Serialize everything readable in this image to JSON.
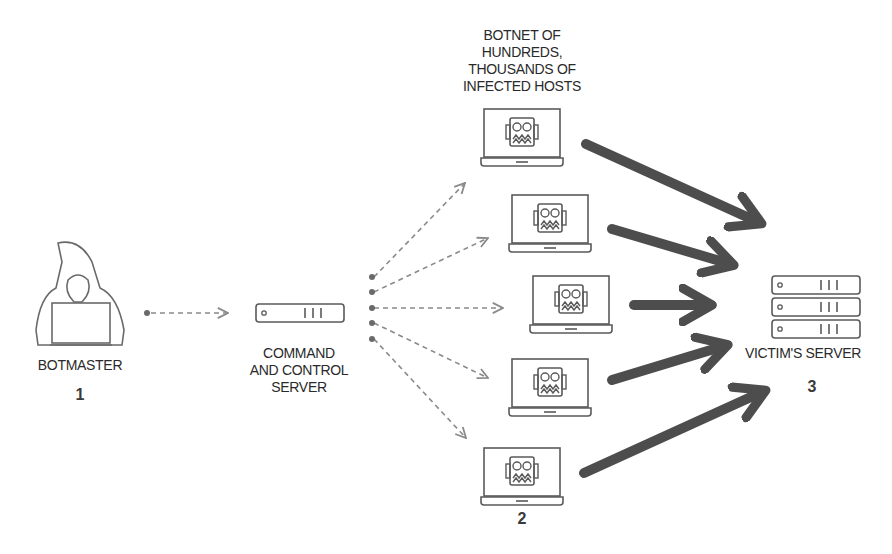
{
  "colors": {
    "line": "#5a5a5a",
    "dash": "#8a8a8a",
    "thick_arrow": "#4d4d4d",
    "background": "#ffffff"
  },
  "nodes": {
    "botmaster": {
      "label": "BOTMASTER",
      "step": "1",
      "icon": "hooded-hacker-icon"
    },
    "cnc": {
      "label_lines": [
        "COMMAND",
        "AND CONTROL",
        "SERVER"
      ],
      "icon": "server-rack-icon"
    },
    "botnet": {
      "label_lines": [
        "BOTNET OF",
        "HUNDREDS,",
        "THOUSANDS OF",
        "INFECTED HOSTS"
      ],
      "step": "2",
      "hosts": [
        {
          "id": "bot-1",
          "icon": "infected-laptop-icon",
          "x": 480,
          "y": 108
        },
        {
          "id": "bot-2",
          "icon": "infected-laptop-icon",
          "x": 508,
          "y": 194
        },
        {
          "id": "bot-3",
          "icon": "infected-laptop-icon",
          "x": 529,
          "y": 275
        },
        {
          "id": "bot-4",
          "icon": "infected-laptop-icon",
          "x": 508,
          "y": 358
        },
        {
          "id": "bot-5",
          "icon": "infected-laptop-icon",
          "x": 480,
          "y": 447
        }
      ]
    },
    "victim": {
      "label": "VICTIM'S SERVER",
      "step": "3",
      "icon": "server-stack-icon"
    }
  }
}
